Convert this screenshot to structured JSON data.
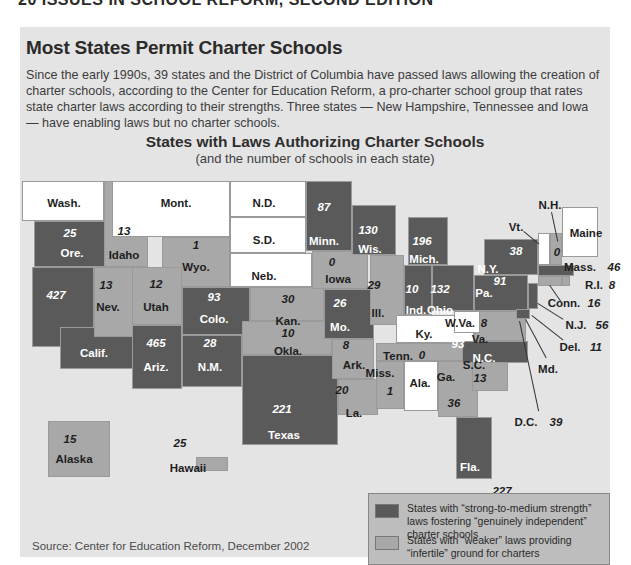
{
  "page_header_cut": "20 ISSUES IN SCHOOL REFORM, SECOND EDITION",
  "panel": {
    "title": "Most States Permit Charter Schools",
    "description": "Since the early 1990s, 39 states and the District of Columbia have passed laws allowing the creation of charter schools, according to the Center for Education Reform, a pro-charter school group that rates state charter laws according to their strengths. Three states — New Hampshire, Tennessee and Iowa — have enabling laws but no charter schools."
  },
  "map": {
    "title": "States with Laws Authorizing Charter Schools",
    "subtitle": "(and the number of schools in each state)",
    "colors": {
      "strong": "#5a5a5a",
      "weak": "#a8a8a8",
      "none": "#ffffff",
      "background": "#e4e4e4"
    },
    "states": [
      {
        "id": "wa",
        "label": "Wash.",
        "count": null,
        "category": "none"
      },
      {
        "id": "or",
        "label": "Ore.",
        "count": "25",
        "category": "strong"
      },
      {
        "id": "ca",
        "label": "Calif.",
        "count": "427",
        "category": "strong"
      },
      {
        "id": "id",
        "label": "Idaho",
        "count": "13",
        "category": "weak"
      },
      {
        "id": "nv",
        "label": "Nev.",
        "count": "13",
        "category": "weak"
      },
      {
        "id": "mt",
        "label": "Mont.",
        "count": null,
        "category": "none"
      },
      {
        "id": "wy",
        "label": "Wyo.",
        "count": "1",
        "category": "weak"
      },
      {
        "id": "ut",
        "label": "Utah",
        "count": "12",
        "category": "weak"
      },
      {
        "id": "az",
        "label": "Ariz.",
        "count": "465",
        "category": "strong"
      },
      {
        "id": "co",
        "label": "Colo.",
        "count": "93",
        "category": "strong"
      },
      {
        "id": "nm",
        "label": "N.M.",
        "count": "28",
        "category": "strong"
      },
      {
        "id": "nd",
        "label": "N.D.",
        "count": null,
        "category": "none"
      },
      {
        "id": "sd",
        "label": "S.D.",
        "count": null,
        "category": "none"
      },
      {
        "id": "ne",
        "label": "Neb.",
        "count": null,
        "category": "none"
      },
      {
        "id": "ks",
        "label": "Kan.",
        "count": "30",
        "category": "weak"
      },
      {
        "id": "ok",
        "label": "Okla.",
        "count": "10",
        "category": "weak"
      },
      {
        "id": "tx",
        "label": "Texas",
        "count": "221",
        "category": "strong"
      },
      {
        "id": "mn",
        "label": "Minn.",
        "count": "87",
        "category": "strong"
      },
      {
        "id": "ia",
        "label": "Iowa",
        "count": "0",
        "category": "weak"
      },
      {
        "id": "mo",
        "label": "Mo.",
        "count": "26",
        "category": "strong"
      },
      {
        "id": "ar",
        "label": "Ark.",
        "count": "8",
        "category": "weak"
      },
      {
        "id": "la",
        "label": "La.",
        "count": "20",
        "category": "weak"
      },
      {
        "id": "wi",
        "label": "Wis.",
        "count": "130",
        "category": "strong"
      },
      {
        "id": "il",
        "label": "Ill.",
        "count": "29",
        "category": "weak"
      },
      {
        "id": "mi",
        "label": "Mich.",
        "count": "196",
        "category": "strong"
      },
      {
        "id": "in",
        "label": "Ind.",
        "count": "10",
        "category": "strong"
      },
      {
        "id": "oh",
        "label": "Ohio",
        "count": "132",
        "category": "strong"
      },
      {
        "id": "ky",
        "label": "Ky.",
        "count": null,
        "category": "none"
      },
      {
        "id": "tn",
        "label": "Tenn.",
        "count": "0",
        "category": "weak"
      },
      {
        "id": "ms",
        "label": "Miss.",
        "count": "1",
        "category": "weak"
      },
      {
        "id": "al",
        "label": "Ala.",
        "count": null,
        "category": "none"
      },
      {
        "id": "ga",
        "label": "Ga.",
        "count": "36",
        "category": "weak"
      },
      {
        "id": "fl",
        "label": "Fla.",
        "count": "227",
        "category": "strong"
      },
      {
        "id": "sc",
        "label": "S.C.",
        "count": "13",
        "category": "weak"
      },
      {
        "id": "nc",
        "label": "N.C.",
        "count": "93",
        "category": "strong"
      },
      {
        "id": "va",
        "label": "Va.",
        "count": "8",
        "category": "weak"
      },
      {
        "id": "wv",
        "label": "W.Va.",
        "count": null,
        "category": "none"
      },
      {
        "id": "pa",
        "label": "Pa.",
        "count": "91",
        "category": "strong"
      },
      {
        "id": "ny",
        "label": "N.Y.",
        "count": "38",
        "category": "strong"
      },
      {
        "id": "vt",
        "label": "Vt.",
        "count": null,
        "category": "none"
      },
      {
        "id": "nh",
        "label": "N.H.",
        "count": "0",
        "category": "weak"
      },
      {
        "id": "me",
        "label": "Maine",
        "count": null,
        "category": "none"
      },
      {
        "id": "ma",
        "label": "Mass.",
        "count": "46",
        "category": "strong"
      },
      {
        "id": "ri",
        "label": "R.I.",
        "count": "8",
        "category": "weak"
      },
      {
        "id": "ct",
        "label": "Conn.",
        "count": "16",
        "category": "weak"
      },
      {
        "id": "nj",
        "label": "N.J.",
        "count": "56",
        "category": "strong"
      },
      {
        "id": "de",
        "label": "Del.",
        "count": "11",
        "category": "strong"
      },
      {
        "id": "md",
        "label": "Md.",
        "count": null,
        "category": "strong"
      },
      {
        "id": "dc",
        "label": "D.C.",
        "count": "39",
        "category": "strong"
      },
      {
        "id": "ak",
        "label": "Alaska",
        "count": "15",
        "category": "weak"
      },
      {
        "id": "hi",
        "label": "Hawaii",
        "count": "25",
        "category": "weak"
      }
    ]
  },
  "legend": {
    "items": [
      {
        "label": "States with “strong-to-medium strength” laws fostering “genuinely independent” charter schools",
        "color": "#5a5a5a"
      },
      {
        "label": "States with “weaker” laws providing “infertile” ground for charters",
        "color": "#a8a8a8"
      }
    ]
  },
  "source": "Source: Center for Education Reform, December 2002"
}
